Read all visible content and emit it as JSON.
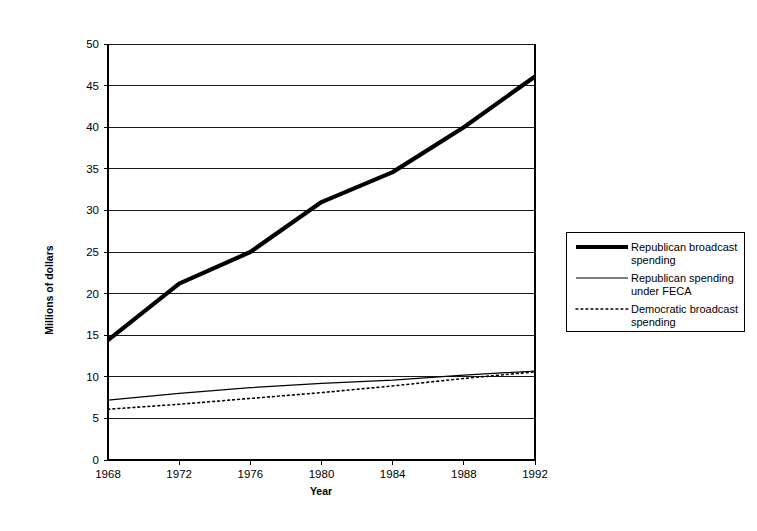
{
  "chart_data": {
    "type": "line",
    "title": "",
    "xlabel": "Year",
    "ylabel": "Millions of dollars",
    "categories": [
      "1968",
      "1972",
      "1976",
      "1980",
      "1984",
      "1988",
      "1992"
    ],
    "x": [
      1968,
      1972,
      1976,
      1980,
      1984,
      1988,
      1992
    ],
    "xlim": [
      1968,
      1992
    ],
    "ylim": [
      0,
      50
    ],
    "ytick_labels": [
      "0",
      "5",
      "10",
      "15",
      "20",
      "25",
      "30",
      "35",
      "40",
      "45",
      "50"
    ],
    "ytick_values": [
      0,
      5,
      10,
      15,
      20,
      25,
      30,
      35,
      40,
      45,
      50
    ],
    "grid": "horizontal",
    "legend_position": "right",
    "series": [
      {
        "name": "Republican broadcast spending",
        "style": "thick-solid",
        "values": [
          14.4,
          21.2,
          25.0,
          31.0,
          34.6,
          40.0,
          46.1
        ]
      },
      {
        "name": "Republican spending under FECA",
        "style": "thin-solid",
        "values": [
          7.2,
          8.0,
          8.7,
          9.2,
          9.6,
          10.2,
          10.7
        ]
      },
      {
        "name": "Democratic broadcast spending",
        "style": "dotted",
        "values": [
          6.1,
          6.7,
          7.4,
          8.1,
          8.9,
          9.8,
          10.6
        ]
      }
    ]
  },
  "legend": {
    "entries": [
      {
        "label_line1": "Republican broadcast",
        "label_line2": "spending",
        "style": "thick-solid"
      },
      {
        "label_line1": "Republican spending",
        "label_line2": "under FECA",
        "style": "thin-solid"
      },
      {
        "label_line1": "Democratic broadcast",
        "label_line2": "spending",
        "style": "dotted"
      }
    ]
  },
  "colors": {
    "background": "#ffffff",
    "ink": "#000000",
    "grid": "#000000"
  }
}
